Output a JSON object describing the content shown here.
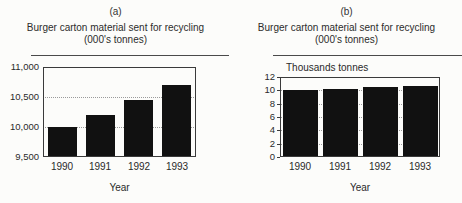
{
  "figure": {
    "background": "#fcfcfa"
  },
  "panels": [
    {
      "panel_label": "(a)",
      "title_line1": "Burger carton material sent for recycling",
      "title_line2": "(000's tonnes)"
    },
    {
      "panel_label": "(b)",
      "title_line1": "Burger carton material sent for recycling",
      "title_line2": "(000's tonnes)",
      "inner_label": "Thousands tonnes"
    }
  ],
  "chart_data": [
    {
      "type": "bar",
      "panel": "(a)",
      "title": "Burger carton material sent for recycling (000's tonnes)",
      "categories": [
        "1990",
        "1991",
        "1992",
        "1993"
      ],
      "values": [
        10000,
        10200,
        10450,
        10700
      ],
      "xlabel": "Year",
      "ylabel": "",
      "ylim": [
        9500,
        11000
      ],
      "yticks": [
        {
          "value": 9500,
          "label": "9,500"
        },
        {
          "value": 10000,
          "label": "10,000"
        },
        {
          "value": 10500,
          "label": "10,500"
        },
        {
          "value": 11000,
          "label": "11,000"
        }
      ],
      "gridlines": [
        10000,
        10500
      ],
      "grid_style": "dotted horizontal",
      "legend": "none",
      "bar_color": "#111111"
    },
    {
      "type": "bar",
      "panel": "(b)",
      "title": "Burger carton material sent for recycling (000's tonnes)",
      "inner_label": "Thousands tonnes",
      "categories": [
        "1990",
        "1991",
        "1992",
        "1993"
      ],
      "values": [
        10.0,
        10.2,
        10.45,
        10.7
      ],
      "xlabel": "Year",
      "ylabel": "",
      "ylim": [
        0,
        12
      ],
      "yticks": [
        {
          "value": 0,
          "label": "0"
        },
        {
          "value": 2,
          "label": "2"
        },
        {
          "value": 4,
          "label": "4"
        },
        {
          "value": 6,
          "label": "6"
        },
        {
          "value": 8,
          "label": "8"
        },
        {
          "value": 10,
          "label": "10"
        },
        {
          "value": 12,
          "label": "12"
        }
      ],
      "gridlines": [
        2,
        4,
        6,
        8,
        10
      ],
      "grid_style": "dotted horizontal",
      "legend": "none",
      "bar_color": "#111111"
    }
  ],
  "colors": {
    "bar": "#111111",
    "frame": "#3a3a3a",
    "gridline": "#9a9a9a",
    "text": "#2a2a2a",
    "title_rule": "#4a4a4a",
    "background": "#fcfcfa"
  }
}
